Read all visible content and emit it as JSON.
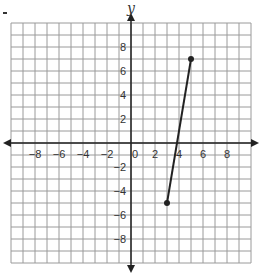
{
  "chart_data": {
    "type": "line",
    "title": "",
    "xlabel": "x",
    "ylabel": "y",
    "xlim": [
      -10,
      10
    ],
    "ylim": [
      -10,
      10
    ],
    "grid": true,
    "x_ticks": [
      -8,
      -6,
      -4,
      -2,
      0,
      2,
      4,
      6,
      8
    ],
    "y_ticks": [
      8,
      6,
      4,
      2,
      -2,
      -4,
      -6,
      -8
    ],
    "series": [
      {
        "name": "segment",
        "points": [
          [
            3,
            -5
          ],
          [
            5,
            7
          ]
        ],
        "endpoints": "closed-dots"
      }
    ]
  },
  "colors": {
    "grid": "#9a9a9a",
    "axis": "#222222",
    "line": "#222222"
  }
}
